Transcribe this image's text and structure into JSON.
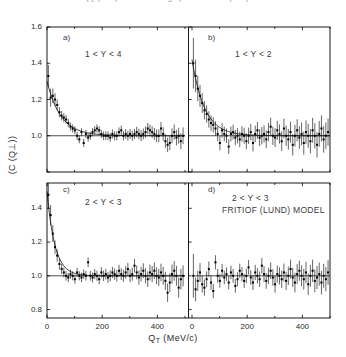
{
  "caption": {
    "text": "correlation function C(Q  ) for pairs of like-sign particles in rapidity intervals"
  },
  "figure": {
    "ylabel": "(C (Q⊥))",
    "xlabel_main": "Q",
    "xlabel_sub": "T",
    "xlabel_unit": "(MeV/c)",
    "x_ticks": [
      "0",
      "200",
      "400"
    ],
    "x_tick_values": [
      0,
      200,
      400
    ],
    "y_ticks_top": [
      "1.6",
      "1.4",
      "1.2",
      "1.0",
      "0.8"
    ],
    "y_ticks_bottom": [
      "1.4",
      "1.2",
      "1.0",
      "0.8"
    ],
    "reference_line": 1.0
  },
  "panels": [
    {
      "tag": "a)",
      "range": "1 < Y < 4",
      "model": "",
      "has_fit_curve": true
    },
    {
      "tag": "b)",
      "range": "1 < Y < 2",
      "model": "",
      "has_fit_curve": true
    },
    {
      "tag": "c)",
      "range": "2 < Y < 3",
      "model": "",
      "has_fit_curve": true
    },
    {
      "tag": "d)",
      "range": "2 < Y < 3",
      "model": "FRITIOF (LUND) MODEL",
      "has_fit_curve": false
    }
  ],
  "chart_data": {
    "type": "scatter",
    "title": "",
    "xlabel": "Q_T (MeV/c)",
    "ylabel": "(C (Q_T))",
    "grid": false,
    "legend": "none",
    "xlim": [
      0,
      500
    ],
    "ylim_top": [
      0.8,
      1.6
    ],
    "ylim_bottom": [
      0.75,
      1.55
    ],
    "reference_line_y": 1.0,
    "error_bars": "vertical",
    "marker": "filled-square",
    "series": [
      {
        "name": "a) 1 < Y < 4",
        "panel": "a",
        "fit_curve": {
          "C0": 1.3,
          "lambda": 0.3,
          "R_slope": 0.02,
          "baseline": 1.0
        },
        "x": [
          5,
          13,
          21,
          29,
          37,
          45,
          53,
          61,
          69,
          77,
          85,
          93,
          101,
          109,
          117,
          125,
          133,
          141,
          149,
          157,
          165,
          173,
          181,
          189,
          197,
          205,
          213,
          221,
          229,
          237,
          245,
          253,
          261,
          269,
          277,
          285,
          293,
          301,
          309,
          317,
          325,
          333,
          341,
          349,
          357,
          365,
          373,
          381,
          389,
          397,
          405,
          413,
          421,
          429,
          437,
          445,
          453,
          461,
          469,
          477,
          485,
          493
        ],
        "y": [
          1.33,
          1.21,
          1.22,
          1.2,
          1.17,
          1.13,
          1.11,
          1.1,
          1.09,
          1.07,
          1.05,
          1.04,
          1.03,
          1.0,
          0.98,
          1.02,
          0.96,
          1.01,
          0.99,
          1.0,
          1.02,
          1.03,
          1.04,
          1.03,
          1.01,
          1.0,
          1.0,
          1.0,
          0.99,
          1.01,
          1.0,
          1.0,
          1.02,
          1.03,
          1.0,
          1.01,
          1.0,
          1.01,
          1.0,
          1.01,
          1.02,
          1.01,
          1.0,
          1.01,
          1.02,
          1.04,
          1.03,
          1.02,
          1.01,
          1.0,
          1.0,
          1.04,
          1.01,
          0.97,
          0.95,
          0.96,
          1.0,
          1.02,
          0.99,
          1.0,
          0.97,
          1.0
        ],
        "yerr": [
          0.06,
          0.05,
          0.04,
          0.035,
          0.03,
          0.028,
          0.026,
          0.025,
          0.024,
          0.023,
          0.022,
          0.022,
          0.022,
          0.022,
          0.022,
          0.022,
          0.022,
          0.022,
          0.022,
          0.022,
          0.023,
          0.023,
          0.023,
          0.023,
          0.023,
          0.024,
          0.024,
          0.024,
          0.024,
          0.025,
          0.025,
          0.025,
          0.026,
          0.026,
          0.026,
          0.027,
          0.027,
          0.027,
          0.028,
          0.028,
          0.029,
          0.029,
          0.03,
          0.03,
          0.031,
          0.031,
          0.032,
          0.033,
          0.033,
          0.034,
          0.035,
          0.036,
          0.037,
          0.038,
          0.039,
          0.04,
          0.041,
          0.042,
          0.043,
          0.044,
          0.045,
          0.046
        ]
      },
      {
        "name": "b) 1 < Y < 2",
        "panel": "b",
        "fit_curve": {
          "C0": 1.42,
          "lambda": 0.42,
          "R_slope": 0.022,
          "baseline": 1.0
        },
        "x": [
          5,
          13,
          21,
          29,
          37,
          45,
          53,
          61,
          69,
          77,
          85,
          93,
          101,
          109,
          117,
          125,
          133,
          141,
          149,
          157,
          165,
          173,
          181,
          189,
          197,
          205,
          213,
          221,
          229,
          237,
          245,
          253,
          261,
          269,
          277,
          285,
          293,
          301,
          309,
          317,
          325,
          333,
          341,
          349,
          357,
          365,
          373,
          381,
          389,
          397,
          405,
          413,
          421,
          429,
          437,
          445,
          453,
          461,
          469,
          477,
          485,
          493
        ],
        "y": [
          1.4,
          1.33,
          1.26,
          1.22,
          1.18,
          1.14,
          1.12,
          1.09,
          1.07,
          1.06,
          1.04,
          1.01,
          0.96,
          1.03,
          1.01,
          1.0,
          0.94,
          1.01,
          1.02,
          0.99,
          1.0,
          0.98,
          1.01,
          1.0,
          0.97,
          1.0,
          1.02,
          0.96,
          1.01,
          1.03,
          0.99,
          1.0,
          1.01,
          0.98,
          1.02,
          1.05,
          1.0,
          0.99,
          1.03,
          1.01,
          0.97,
          1.04,
          1.0,
          0.98,
          1.02,
          0.95,
          1.0,
          1.03,
          0.99,
          1.01,
          0.96,
          1.02,
          1.0,
          0.97,
          1.03,
          1.0,
          0.95,
          1.01,
          1.04,
          0.98,
          1.0,
          1.02
        ],
        "yerr": [
          0.14,
          0.09,
          0.07,
          0.06,
          0.055,
          0.05,
          0.048,
          0.045,
          0.043,
          0.042,
          0.04,
          0.04,
          0.04,
          0.04,
          0.04,
          0.04,
          0.041,
          0.041,
          0.041,
          0.042,
          0.042,
          0.043,
          0.043,
          0.044,
          0.044,
          0.045,
          0.045,
          0.046,
          0.046,
          0.047,
          0.047,
          0.048,
          0.048,
          0.049,
          0.05,
          0.05,
          0.051,
          0.052,
          0.052,
          0.053,
          0.054,
          0.055,
          0.056,
          0.057,
          0.058,
          0.059,
          0.06,
          0.061,
          0.062,
          0.063,
          0.064,
          0.065,
          0.066,
          0.067,
          0.068,
          0.069,
          0.07,
          0.071,
          0.072,
          0.073,
          0.074,
          0.075
        ]
      },
      {
        "name": "c) 2 < Y < 3",
        "panel": "c",
        "fit_curve": {
          "C0": 1.5,
          "lambda": 0.5,
          "R_slope": 0.035,
          "baseline": 1.0
        },
        "x": [
          5,
          13,
          21,
          29,
          37,
          45,
          53,
          61,
          69,
          77,
          85,
          93,
          101,
          109,
          117,
          125,
          133,
          141,
          149,
          157,
          165,
          173,
          181,
          189,
          197,
          205,
          213,
          221,
          229,
          237,
          245,
          253,
          261,
          269,
          277,
          285,
          293,
          301,
          309,
          317,
          325,
          333,
          341,
          349,
          357,
          365,
          373,
          381,
          389,
          397,
          405,
          413,
          421,
          429,
          437,
          445,
          453,
          461,
          469,
          477,
          485,
          493
        ],
        "y": [
          1.48,
          1.36,
          1.25,
          1.17,
          1.12,
          1.07,
          1.04,
          1.02,
          1.0,
          0.99,
          1.01,
          1.0,
          0.98,
          1.02,
          1.0,
          0.99,
          1.01,
          1.0,
          1.08,
          1.0,
          0.99,
          1.01,
          1.0,
          0.98,
          1.02,
          1.0,
          1.01,
          0.99,
          1.0,
          1.02,
          1.01,
          1.0,
          1.03,
          1.01,
          1.0,
          1.02,
          1.04,
          1.0,
          1.01,
          1.06,
          1.02,
          0.99,
          1.01,
          1.03,
          1.0,
          0.98,
          1.02,
          1.01,
          1.03,
          1.0,
          0.99,
          1.02,
          1.0,
          0.97,
          0.9,
          0.96,
          1.01,
          1.03,
          1.0,
          0.93,
          0.98,
          1.0
        ],
        "yerr": [
          0.08,
          0.06,
          0.05,
          0.04,
          0.035,
          0.032,
          0.03,
          0.029,
          0.028,
          0.027,
          0.027,
          0.027,
          0.027,
          0.027,
          0.027,
          0.028,
          0.028,
          0.028,
          0.029,
          0.029,
          0.029,
          0.03,
          0.03,
          0.03,
          0.031,
          0.031,
          0.032,
          0.032,
          0.033,
          0.033,
          0.034,
          0.034,
          0.035,
          0.035,
          0.036,
          0.037,
          0.037,
          0.038,
          0.039,
          0.04,
          0.041,
          0.042,
          0.043,
          0.044,
          0.045,
          0.046,
          0.047,
          0.048,
          0.049,
          0.05,
          0.051,
          0.052,
          0.053,
          0.054,
          0.055,
          0.056,
          0.057,
          0.058,
          0.059,
          0.06,
          0.061,
          0.062
        ]
      },
      {
        "name": "d) 2 < Y < 3 FRITIOF (LUND) MODEL",
        "panel": "d",
        "fit_curve": null,
        "x": [
          5,
          13,
          21,
          29,
          37,
          45,
          53,
          61,
          69,
          77,
          85,
          93,
          101,
          109,
          117,
          125,
          133,
          141,
          149,
          157,
          165,
          173,
          181,
          189,
          197,
          205,
          213,
          221,
          229,
          237,
          245,
          253,
          261,
          269,
          277,
          285,
          293,
          301,
          309,
          317,
          325,
          333,
          341,
          349,
          357,
          365,
          373,
          381,
          389,
          397,
          405,
          413,
          421,
          429,
          437,
          445,
          453,
          461,
          469,
          477,
          485,
          493
        ],
        "y": [
          1.0,
          0.92,
          0.97,
          1.02,
          0.95,
          0.93,
          0.98,
          1.04,
          0.96,
          0.91,
          1.08,
          1.0,
          0.97,
          1.03,
          0.99,
          1.01,
          0.96,
          1.02,
          1.0,
          0.94,
          0.98,
          1.03,
          1.01,
          0.97,
          1.0,
          1.05,
          0.99,
          0.96,
          1.02,
          1.0,
          0.98,
          1.06,
          1.01,
          0.97,
          1.0,
          1.03,
          0.99,
          0.95,
          1.01,
          1.0,
          0.98,
          1.02,
          0.97,
          1.0,
          1.04,
          0.99,
          0.96,
          1.01,
          1.03,
          1.0,
          0.98,
          1.02,
          0.95,
          1.0,
          1.03,
          0.97,
          0.99,
          1.01,
          0.96,
          1.0,
          0.98,
          1.02
        ],
        "yerr": [
          0.13,
          0.07,
          0.06,
          0.055,
          0.05,
          0.048,
          0.046,
          0.045,
          0.044,
          0.043,
          0.042,
          0.041,
          0.04,
          0.04,
          0.04,
          0.04,
          0.04,
          0.04,
          0.041,
          0.041,
          0.041,
          0.042,
          0.042,
          0.042,
          0.043,
          0.043,
          0.044,
          0.044,
          0.045,
          0.045,
          0.046,
          0.046,
          0.047,
          0.047,
          0.048,
          0.049,
          0.049,
          0.05,
          0.051,
          0.051,
          0.052,
          0.053,
          0.054,
          0.055,
          0.056,
          0.057,
          0.058,
          0.059,
          0.06,
          0.061,
          0.062,
          0.063,
          0.064,
          0.065,
          0.066,
          0.067,
          0.068,
          0.069,
          0.07,
          0.071,
          0.072,
          0.073
        ]
      }
    ]
  }
}
